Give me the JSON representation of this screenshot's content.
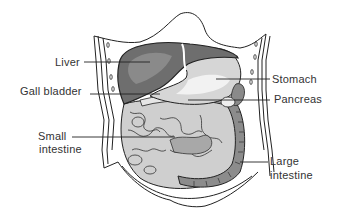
{
  "diagram": {
    "labels": [
      {
        "id": "liver",
        "text": "Liver"
      },
      {
        "id": "gall_bladder",
        "text": "Gall bladder"
      },
      {
        "id": "small_intestine_1",
        "text": "Small"
      },
      {
        "id": "small_intestine_2",
        "text": "intestine"
      },
      {
        "id": "stomach",
        "text": "Stomach"
      },
      {
        "id": "pancreas",
        "text": "Pancreas"
      },
      {
        "id": "large_intestine_1",
        "text": "Large"
      },
      {
        "id": "large_intestine_2",
        "text": "intestine"
      }
    ],
    "colors": {
      "background": "#ffffff",
      "outline": "#222222",
      "liver": "#6e6e6e",
      "liver_highlight": "#8a8a8a",
      "stomach": "#d6d6d6",
      "stomach_highlight": "#f2f2f2",
      "small_intestine": "#c9c9c9",
      "large_intestine": "#8c8c8c",
      "label_text": "#333333"
    }
  }
}
